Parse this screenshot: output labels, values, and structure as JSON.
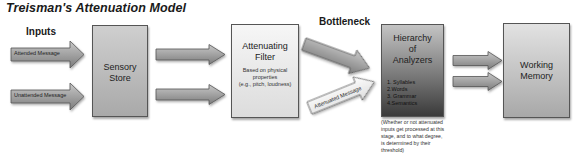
{
  "title": "Treisman's Attenuation Model",
  "inputs_label": "Inputs",
  "input_arrows": [
    {
      "label": "Attended Message"
    },
    {
      "label": "Unattended Message"
    }
  ],
  "stages": {
    "sensory_store": {
      "title_line1": "Sensory",
      "title_line2": "Store"
    },
    "attenuating_filter": {
      "title_line1": "Attenuating",
      "title_line2": "Filter",
      "sub_line1": "Based on physical",
      "sub_line2": "properties",
      "sub_line3": "(e.g., pitch, loudness)"
    },
    "hierarchy": {
      "title_line1": "Hierarchy",
      "title_line2": "of",
      "title_line3": "Analyzers",
      "items": [
        "1. Syllables",
        "2.Words",
        "3. Grammar",
        "4.Semantics"
      ]
    },
    "working_memory": {
      "title_line1": "Working",
      "title_line2": "Memory"
    }
  },
  "bottleneck_label": "Bottleneck",
  "attenuated_arrow": {
    "label": "Attenuated Message"
  },
  "caption": {
    "line1": "(Whether or not attenuated",
    "line2": "inputs get processed at this",
    "line3": "stage, and to what degree,",
    "line4": "is determined by their",
    "line5": "threshold)"
  },
  "colors": {
    "arrow_fill": "#9a9a9a",
    "arrow_stroke": "#555555",
    "light_arrow_fill": "#f4f4f4"
  }
}
